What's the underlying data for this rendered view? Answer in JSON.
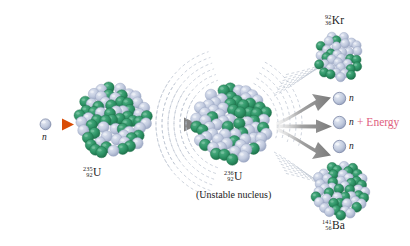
{
  "figure": {
    "kind": "nuclear-fission-diagram",
    "background": "#ffffff",
    "width": 410,
    "height": 246
  },
  "palette": {
    "nucleon_green": "#2e9466",
    "nucleon_green_dark": "#1f7a50",
    "nucleon_blue": "#c2cbdf",
    "nucleon_blue_dark": "#9aa6c2",
    "neutron_fill": "#c6cfe2",
    "neutron_stroke": "#7b87a6",
    "arrow_gray": "#8f8f8f",
    "arrow_orange": "#e2590f",
    "arrow_orange_light": "#f6a24a",
    "vibration_line": "#b9c2cf",
    "text": "#1b1b1b",
    "energy_text": "#e0607e"
  },
  "incoming": {
    "neutron_label": "n",
    "arrow_name": "orange-arrow",
    "arrow_direction": "right"
  },
  "target_nucleus": {
    "mass_number": "235",
    "atomic_number": "92",
    "symbol": "U",
    "protons_color": "#2e9466",
    "neutrons_color": "#c2cbdf"
  },
  "compound_nucleus": {
    "mass_number": "236",
    "atomic_number": "92",
    "symbol": "U",
    "caption": "(Unstable nucleus)",
    "vibrating": true
  },
  "transition_arrow": {
    "name": "gray-arrow",
    "direction": "right"
  },
  "fragments": [
    {
      "id": "krypton",
      "mass_number": "92",
      "atomic_number": "36",
      "symbol": "Kr",
      "position": "top-right"
    },
    {
      "id": "barium",
      "mass_number": "141",
      "atomic_number": "56",
      "symbol": "Ba",
      "position": "bottom-right"
    }
  ],
  "emitted_neutrons": [
    {
      "label": "n"
    },
    {
      "label": "n"
    },
    {
      "label": "n"
    }
  ],
  "energy": {
    "label": "+ Energy"
  }
}
